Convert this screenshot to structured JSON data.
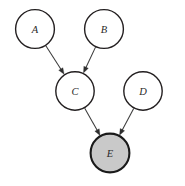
{
  "figure": {
    "kind": "directed-acyclic-graph",
    "title": "",
    "background_color": "#ffffff",
    "width": 185,
    "height": 186
  },
  "style": {
    "node_fill": "#ffffff",
    "node_shaded_fill": "#c9c9c9",
    "node_stroke": "#231f20",
    "node_shaded_stroke": "#1a1a1a",
    "edge_color": "#3b3b3b",
    "arrow_color": "#2e2e2e",
    "label_color": "#2a2a2a"
  },
  "nodes": [
    {
      "id": "A",
      "label": "A",
      "cx": 35,
      "cy": 29,
      "r": 19.4,
      "shaded": false
    },
    {
      "id": "B",
      "label": "B",
      "cx": 104,
      "cy": 29,
      "r": 19.4,
      "shaded": false
    },
    {
      "id": "C",
      "label": "C",
      "cx": 75,
      "cy": 91,
      "r": 19.2,
      "shaded": false
    },
    {
      "id": "D",
      "label": "D",
      "cx": 143,
      "cy": 91,
      "r": 19.2,
      "shaded": false
    },
    {
      "id": "E",
      "label": "E",
      "cx": 110,
      "cy": 153,
      "r": 19.4,
      "shaded": true
    }
  ],
  "edges": [
    {
      "id": "A-C",
      "from": "A",
      "to": "C",
      "directed": true
    },
    {
      "id": "B-C",
      "from": "B",
      "to": "C",
      "directed": true
    },
    {
      "id": "C-E",
      "from": "C",
      "to": "E",
      "directed": true
    },
    {
      "id": "D-E",
      "from": "D",
      "to": "E",
      "directed": true
    }
  ]
}
